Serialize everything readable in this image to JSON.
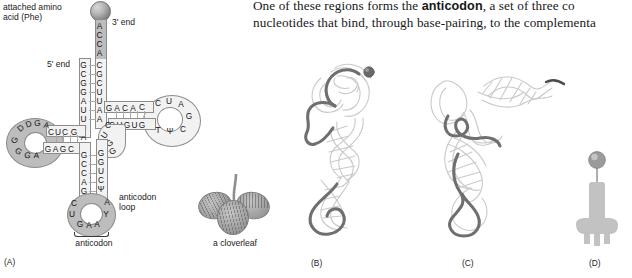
{
  "body_text": {
    "line1_pre": "One of these regions forms the ",
    "line1_bold": "anticodon",
    "line1_post": ", a set of three co",
    "line2": "nucleotides that bind, through base-pairing, to the complementa"
  },
  "panelA": {
    "label": "(A)",
    "amino_acid_label_line1": "attached amino",
    "amino_acid_label_line2": "acid (Phe)",
    "three_prime_label": "3' end",
    "five_prime_label": "5' end",
    "anticodon_loop_label_line1": "anticodon",
    "anticodon_loop_label_line2": "loop",
    "anticodon_label": "anticodon",
    "acceptor_stem_3p": [
      "A",
      "C",
      "C",
      "A",
      "C",
      "G",
      "C",
      "U",
      "U",
      "A",
      "A"
    ],
    "acceptor_stem_5p": [
      "G",
      "C",
      "G",
      "G",
      "A",
      "U",
      "U",
      "U",
      "A"
    ],
    "d_stem_top": [
      "C",
      "U",
      "C",
      "G"
    ],
    "d_stem_bottom": [
      "G",
      "A",
      "G",
      "C"
    ],
    "d_loop_top": [
      "D",
      "D",
      "G",
      "A"
    ],
    "d_loop_bottom": [
      "G",
      "G",
      "G",
      "A"
    ],
    "t_stem_top": [
      "G",
      "A",
      "C",
      "A",
      "C"
    ],
    "t_stem_bottom": [
      "C",
      "U",
      "G",
      "U",
      "G"
    ],
    "t_loop": [
      "C",
      "U",
      "A",
      "G",
      "C",
      "Ψ",
      "T"
    ],
    "variable_loop": [
      "C",
      "U",
      "G",
      "A",
      "G"
    ],
    "anticodon_stem_left": [
      "G",
      "C",
      "C",
      "A",
      "G"
    ],
    "anticodon_stem_right": [
      "G",
      "G",
      "U",
      "C",
      "Ψ"
    ],
    "anticodon_loop": [
      "C",
      "U",
      "G",
      "A",
      "A",
      "Y",
      "A"
    ]
  },
  "cloverleaf": {
    "caption": "a cloverleaf"
  },
  "panelB": {
    "label": "(B)"
  },
  "panelC": {
    "label": "(C)"
  },
  "panelD": {
    "label": "(D)"
  },
  "colors": {
    "shaded_loop": "#bdbdbd",
    "ribbon_fill": "#f2f2f2",
    "outline": "#8a8a8a",
    "text": "#1b1b1b",
    "ribbon_dark": "#6f6f6f",
    "ribbon_light": "#d9d9d9"
  }
}
